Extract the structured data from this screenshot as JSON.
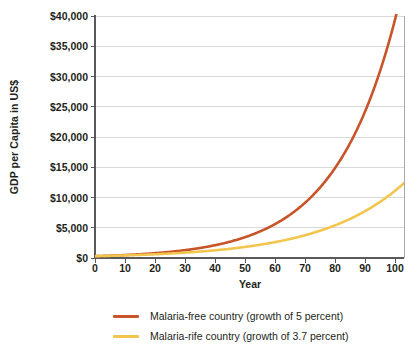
{
  "chart_data": {
    "type": "line",
    "title": "",
    "xlabel": "Year",
    "ylabel": "GDP per Capita in US$",
    "xlim": [
      0,
      103
    ],
    "ylim": [
      0,
      40000
    ],
    "grid": true,
    "legend_position": "bottom",
    "x_ticks": [
      0,
      10,
      20,
      30,
      40,
      50,
      60,
      70,
      80,
      90,
      100
    ],
    "x_tick_labels": [
      "0",
      "10",
      "20",
      "30",
      "40",
      "50",
      "60",
      "70",
      "80",
      "90",
      "100"
    ],
    "y_ticks": [
      0,
      5000,
      10000,
      15000,
      20000,
      25000,
      30000,
      35000,
      40000
    ],
    "y_tick_labels": [
      "$0",
      "$5,000",
      "$10,000",
      "$15,000",
      "$20,000",
      "$25,000",
      "$30,000",
      "$35,000",
      "$40,000"
    ],
    "x": [
      0,
      5,
      10,
      15,
      20,
      25,
      30,
      35,
      40,
      45,
      50,
      55,
      60,
      65,
      70,
      75,
      80,
      85,
      90,
      95,
      100,
      103
    ],
    "series": [
      {
        "name": "Malaria-free country (growth of 5 percent)",
        "color": "#C8552A",
        "growth_rate_percent": 5,
        "initial_value": 300,
        "final_value": 39500,
        "values": [
          300,
          383,
          489,
          624,
          796,
          1016,
          1296,
          1654,
          2112,
          2694,
          3439,
          4388,
          5600,
          7147,
          9121,
          11640,
          14855,
          18957,
          24192,
          30873,
          39395,
          45604
        ]
      },
      {
        "name": "Malaria-rife country (growth of 3.7 percent)",
        "color": "#F2C64E",
        "growth_rate_percent": 3.7,
        "initial_value": 300,
        "final_value": 11400,
        "values": [
          300,
          359,
          431,
          516,
          618,
          741,
          887,
          1063,
          1273,
          1525,
          1827,
          2188,
          2621,
          3139,
          3760,
          4503,
          5394,
          6460,
          7738,
          9268,
          11100,
          12377
        ]
      }
    ]
  },
  "axis": {
    "ylabel": "GDP per Capita in US$",
    "xlabel": "Year"
  },
  "legend": {
    "entries": [
      {
        "label": "Malaria-free country (growth of 5 percent)",
        "color": "#C8552A"
      },
      {
        "label": "Malaria-rife country (growth of 3.7 percent)",
        "color": "#F2C64E"
      }
    ]
  },
  "colors": {
    "malaria_free": "#C8552A",
    "malaria_rife": "#F2C64E",
    "axis": "#58595b",
    "grid": "#d9d9d9",
    "text": "#231f20",
    "background": "#ffffff"
  }
}
